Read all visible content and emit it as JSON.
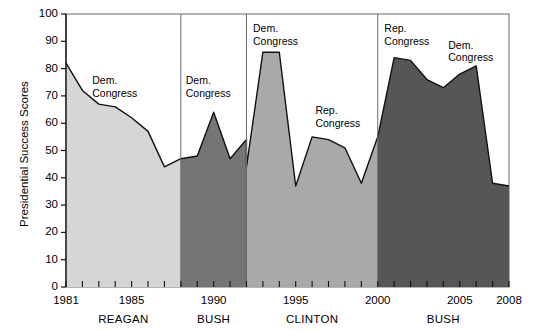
{
  "chart_data": {
    "type": "area",
    "title": "",
    "xlabel": "",
    "ylabel": "Presidential Success Scores",
    "ylim": [
      0,
      100
    ],
    "xlim": [
      1981,
      2008
    ],
    "ytick_labels": [
      "0",
      "10",
      "20",
      "30",
      "40",
      "50",
      "60",
      "70",
      "80",
      "90",
      "100"
    ],
    "ytick_values": [
      0,
      10,
      20,
      30,
      40,
      50,
      60,
      70,
      80,
      90,
      100
    ],
    "xtick_labels": [
      "1981",
      "1985",
      "1990",
      "1995",
      "2000",
      "2005",
      "2008"
    ],
    "xtick_values": [
      1981,
      1985,
      1990,
      1995,
      2000,
      2005,
      2008
    ],
    "grid": false,
    "legend_position": "none",
    "x": [
      1981,
      1982,
      1983,
      1984,
      1985,
      1986,
      1987,
      1988,
      1989,
      1990,
      1991,
      1992,
      1993,
      1994,
      1995,
      1996,
      1997,
      1998,
      1999,
      2000,
      2001,
      2002,
      2003,
      2004,
      2005,
      2006,
      2007,
      2008
    ],
    "values": [
      82,
      72,
      67,
      66,
      62,
      57,
      44,
      47,
      48,
      64,
      47,
      54,
      86,
      86,
      37,
      55,
      54,
      51,
      38,
      55,
      84,
      83,
      76,
      73,
      78,
      81,
      38,
      37
    ],
    "series": [
      {
        "name": "REAGAN",
        "color": "#d6d6d6",
        "x": [
          1981,
          1982,
          1983,
          1984,
          1985,
          1986,
          1987,
          1988
        ],
        "values": [
          82,
          72,
          67,
          66,
          62,
          57,
          44,
          47
        ]
      },
      {
        "name": "BUSH",
        "color": "#757575",
        "x": [
          1988,
          1989,
          1990,
          1991,
          1992
        ],
        "values": [
          47,
          48,
          64,
          47,
          54
        ]
      },
      {
        "name": "CLINTON",
        "color": "#a9a9a9",
        "x": [
          1992,
          1993,
          1994,
          1995,
          1996,
          1997,
          1998,
          1999,
          2000
        ],
        "values": [
          44,
          86,
          86,
          37,
          55,
          54,
          51,
          38,
          55
        ]
      },
      {
        "name": "BUSH",
        "color": "#565656",
        "x": [
          2000,
          2001,
          2002,
          2003,
          2004,
          2005,
          2006,
          2007,
          2008
        ],
        "values": [
          55,
          84,
          83,
          76,
          73,
          78,
          81,
          38,
          37
        ]
      }
    ],
    "presidents": [
      {
        "name": "REAGAN",
        "start": 1981,
        "end": 1988
      },
      {
        "name": "BUSH",
        "start": 1988,
        "end": 1992
      },
      {
        "name": "CLINTON",
        "start": 1992,
        "end": 2000
      },
      {
        "name": "BUSH",
        "start": 2000,
        "end": 2008
      }
    ],
    "annotations": [
      {
        "text_line1": "Dem.",
        "text_line2": "Congress",
        "x": 1982.6,
        "y": 78
      },
      {
        "text_line1": "Dem.",
        "text_line2": "Congress",
        "x": 1988.3,
        "y": 78
      },
      {
        "text_line1": "Dem.",
        "text_line2": "Congress",
        "x": 1992.4,
        "y": 97
      },
      {
        "text_line1": "Rep.",
        "text_line2": "Congress",
        "x": 1996.2,
        "y": 67
      },
      {
        "text_line1": "Rep.",
        "text_line2": "Congress",
        "x": 2000.4,
        "y": 97
      },
      {
        "text_line1": "Dem.",
        "text_line2": "Congress",
        "x": 2004.3,
        "y": 91
      }
    ]
  }
}
